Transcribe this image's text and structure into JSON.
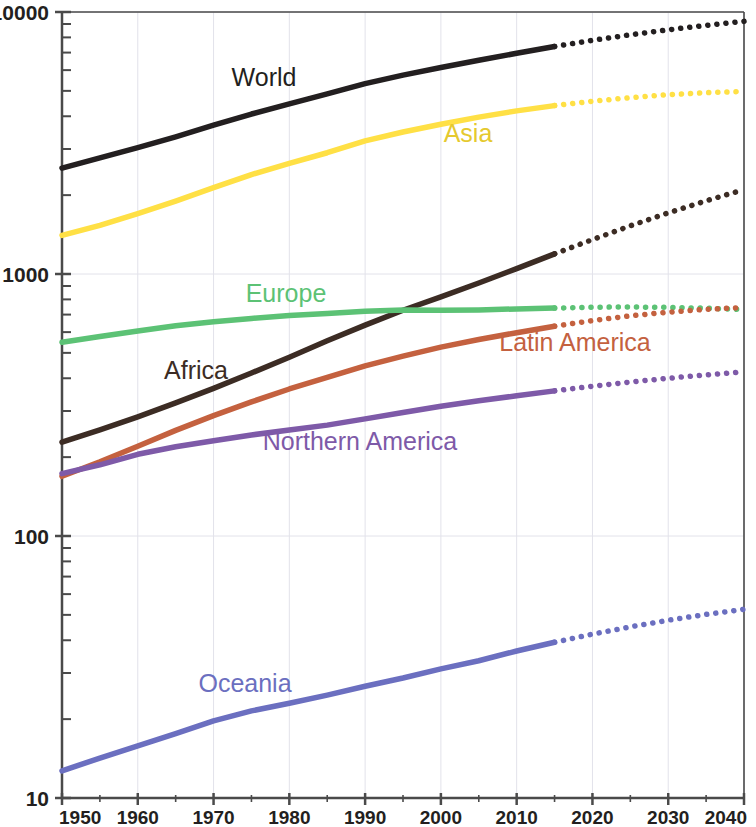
{
  "chart_data": {
    "type": "line",
    "title": "",
    "subtitle": "",
    "xlabel": "",
    "ylabel": "",
    "xlim": [
      1950,
      2040
    ],
    "ylim": [
      10,
      10000
    ],
    "yscale": "log",
    "grid": true,
    "legend_position": "inline-labels",
    "x_ticks": [
      "1950",
      "1960",
      "1970",
      "1980",
      "1990",
      "2000",
      "2010",
      "2020",
      "2030",
      "2040"
    ],
    "y_ticks": [
      "10",
      "100",
      "1000",
      "10000"
    ],
    "forecast_start": 2015,
    "note": "solid line = historical through 2015; dotted line = projection 2015-2040",
    "x": [
      1950,
      1955,
      1960,
      1965,
      1970,
      1975,
      1980,
      1985,
      1990,
      1995,
      2000,
      2005,
      2010,
      2015,
      2020,
      2025,
      2030,
      2035,
      2040
    ],
    "series": [
      {
        "name": "World",
        "color": "#231f20",
        "label_color": "#231f20",
        "label_x": 264,
        "label_y": 86,
        "values": [
          2536,
          2773,
          3035,
          3340,
          3700,
          4079,
          4458,
          4871,
          5327,
          5744,
          6143,
          6542,
          6957,
          7383,
          7795,
          8185,
          8551,
          8892,
          9210
        ]
      },
      {
        "name": "Asia",
        "color": "#ffe045",
        "label_color": "#e5c92e",
        "label_x": 468,
        "label_y": 142,
        "values": [
          1404,
          1534,
          1700,
          1899,
          2135,
          2397,
          2642,
          2903,
          3221,
          3483,
          3730,
          3968,
          4194,
          4393,
          4565,
          4712,
          4835,
          4923,
          4974
        ]
      },
      {
        "name": "Africa",
        "color": "#3c2c24",
        "label_color": "#3c2c24",
        "label_x": 196,
        "label_y": 379,
        "values": [
          228,
          254,
          285,
          322,
          366,
          419,
          481,
          556,
          638,
          727,
          818,
          924,
          1049,
          1194,
          1353,
          1527,
          1712,
          1903,
          2100
        ]
      },
      {
        "name": "Europe",
        "color": "#5cc275",
        "label_color": "#5cc275",
        "label_x": 286,
        "label_y": 302,
        "values": [
          549,
          577,
          606,
          635,
          657,
          677,
          694,
          707,
          721,
          728,
          727,
          729,
          736,
          741,
          747,
          748,
          746,
          740,
          732
        ]
      },
      {
        "name": "Latin America",
        "color": "#c4613f",
        "label_color": "#c4613f",
        "label_x": 575,
        "label_y": 351,
        "values": [
          169,
          192,
          220,
          253,
          288,
          325,
          364,
          403,
          446,
          486,
          526,
          562,
          597,
          632,
          664,
          692,
          715,
          733,
          745
        ]
      },
      {
        "name": "Northern America",
        "color": "#7e5aa8",
        "label_color": "#7e5aa8",
        "label_x": 360,
        "label_y": 450,
        "values": [
          173,
          187,
          205,
          219,
          231,
          243,
          254,
          265,
          280,
          296,
          313,
          328,
          343,
          358,
          373,
          387,
          400,
          412,
          423
        ]
      },
      {
        "name": "Oceania",
        "color": "#6b6fc0",
        "label_color": "#6b6fc0",
        "label_x": 245,
        "label_y": 692,
        "values": [
          12.7,
          14.2,
          15.8,
          17.6,
          19.7,
          21.5,
          23.0,
          24.7,
          26.7,
          28.7,
          31.1,
          33.4,
          36.4,
          39.3,
          42.2,
          45.0,
          47.7,
          50.2,
          52.5
        ]
      }
    ]
  },
  "axes": {
    "y_ticks": [
      {
        "label": "10000",
        "value": 10000
      },
      {
        "label": "1000",
        "value": 1000
      },
      {
        "label": "100",
        "value": 100
      },
      {
        "label": "10",
        "value": 10
      }
    ],
    "x_ticks": [
      {
        "label": "1950",
        "value": 1950
      },
      {
        "label": "1960",
        "value": 1960
      },
      {
        "label": "1970",
        "value": 1970
      },
      {
        "label": "1980",
        "value": 1980
      },
      {
        "label": "1990",
        "value": 1990
      },
      {
        "label": "2000",
        "value": 2000
      },
      {
        "label": "2010",
        "value": 2010
      },
      {
        "label": "2020",
        "value": 2020
      },
      {
        "label": "2030",
        "value": 2030
      },
      {
        "label": "2040",
        "value": 2040
      }
    ]
  },
  "style": {
    "axis_color": "#4a4a4a",
    "grid_color": "#e2e2ea",
    "background": "#ffffff"
  }
}
